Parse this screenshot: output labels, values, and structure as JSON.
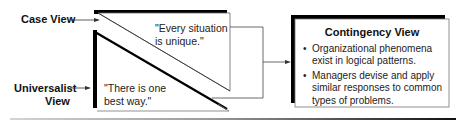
{
  "diagram": {
    "case_view": {
      "label": "Case View",
      "quote": "\"Every situation is unique.\"",
      "quote_line1": "\"Every situation",
      "quote_line2": "is unique.\""
    },
    "universalist_view": {
      "label_line1": "Universalist",
      "label_line2": "View",
      "quote_line1": "\"There is one",
      "quote_line2": "best way.\""
    },
    "contingency_view": {
      "title": "Contingency View",
      "bullets": [
        {
          "marker": "•",
          "text": "Organizational phenomena exist in logical patterns."
        },
        {
          "marker": "•",
          "text": "Managers devise and apply similar responses to common types of problems."
        }
      ]
    },
    "colors": {
      "line": "#1a1a1a",
      "shadow": "#000000",
      "box_fill": "#ffffff",
      "box_border": "#777777"
    }
  }
}
